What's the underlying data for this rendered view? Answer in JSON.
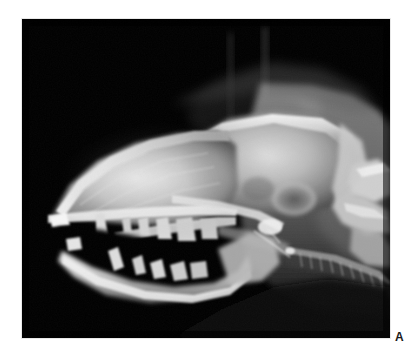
{
  "figure": {
    "panel_letter": "A",
    "modality": "radiograph",
    "view": "lateral",
    "background_color": "#000000",
    "page_color": "#ffffff",
    "label_color": "#1a1a1a",
    "plate": {
      "x": 22,
      "y": 19,
      "width": 368,
      "height": 319
    },
    "anatomy_labels": [
      "nasal cavity",
      "maxilla",
      "hard palate",
      "upper canine tooth",
      "lower canine tooth",
      "mandible",
      "cranium",
      "tympanic bulla",
      "atlas vertebra",
      "axis vertebra",
      "cervical vertebrae",
      "trachea",
      "soft palate",
      "tongue"
    ],
    "grayscale_stops": {
      "air_black": "#000000",
      "soft_tissue_dark": "#2a2a2a",
      "soft_tissue_mid": "#6e6e6e",
      "bone_mid": "#a8a8a8",
      "bone_bright": "#d8d8d8",
      "bone_peak": "#f2f2f2"
    }
  }
}
